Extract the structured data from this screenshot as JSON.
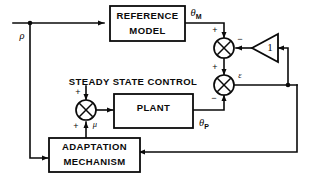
{
  "diagram": {
    "blocks": {
      "reference_model": {
        "line1": "REFERENCE",
        "line2": "MODEL"
      },
      "plant": {
        "label": "PLANT"
      },
      "adaptation_mechanism": {
        "line1": "ADAPTATION",
        "line2": "MECHANISM"
      },
      "gain": {
        "label": "1"
      }
    },
    "annotations": {
      "steady_state_control": "STEADY STATE CONTROL"
    },
    "signals": {
      "input": {
        "symbol": "ρ",
        "subscript": ""
      },
      "model_output": {
        "symbol": "θ",
        "subscript": "M"
      },
      "plant_output": {
        "symbol": "θ",
        "subscript": "P"
      },
      "error": {
        "symbol": "ε",
        "subscript": ""
      },
      "control": {
        "symbol": "μ",
        "subscript": ""
      }
    },
    "signs": {
      "upper_sum_top": "+",
      "upper_sum_right": "−",
      "lower_sum_top": "+",
      "lower_sum_bottom": "−",
      "left_sum_top": "+",
      "left_sum_bottom": "+"
    },
    "colors": {
      "stroke": "#0a0a0a",
      "background": "#ffffff",
      "text": "#0a0a0a"
    }
  }
}
